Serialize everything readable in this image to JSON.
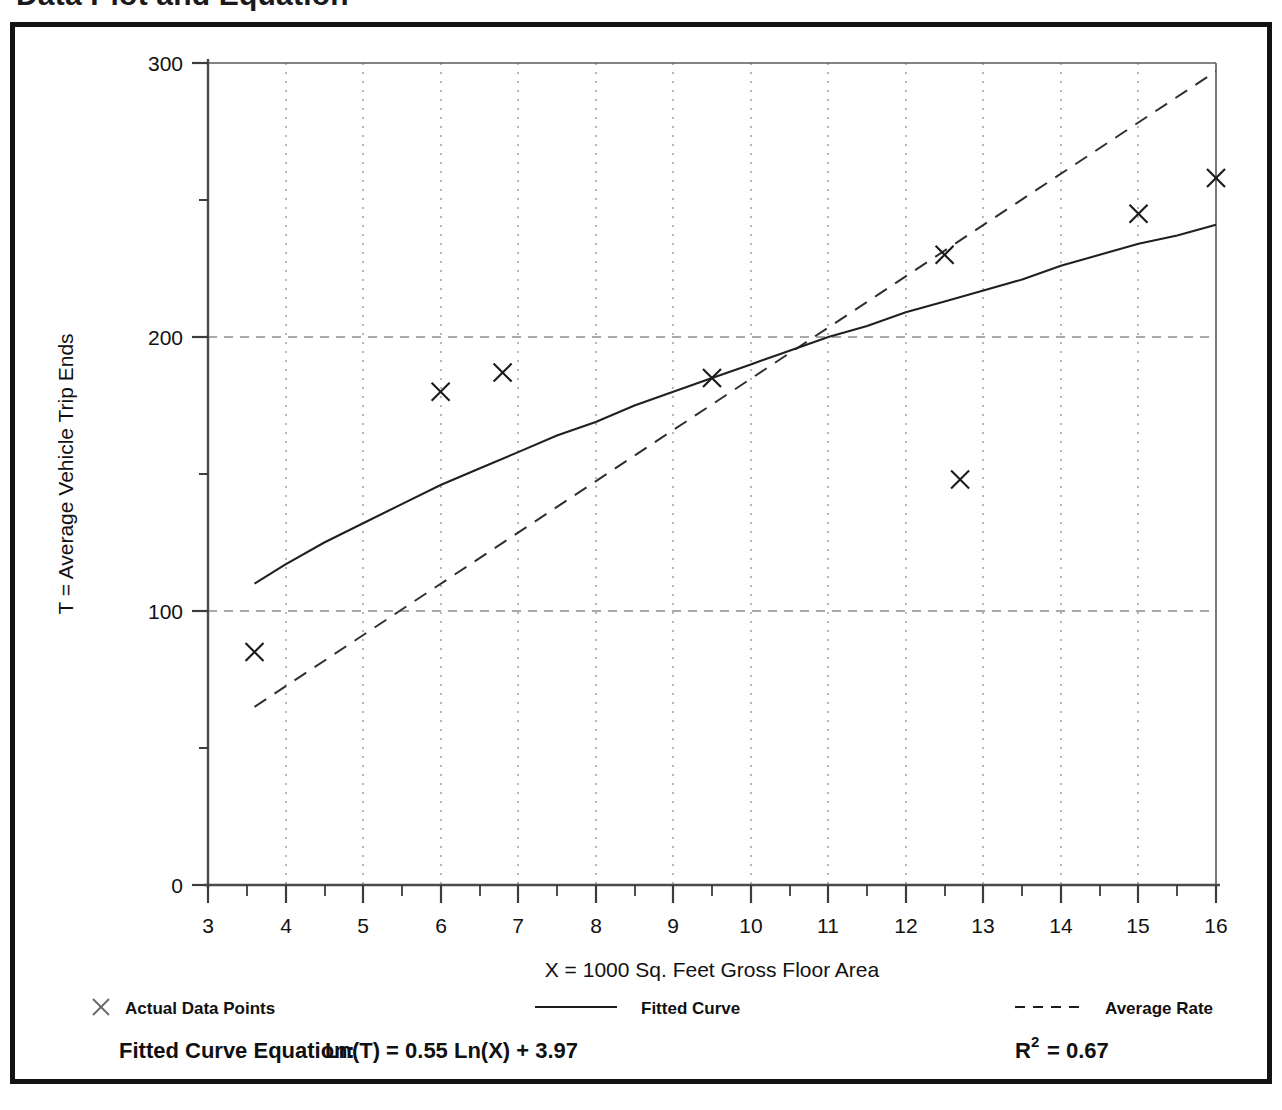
{
  "document": {
    "title": "Data Plot and Equation"
  },
  "chart_data": {
    "type": "scatter",
    "title": "Data Plot and Equation",
    "xlabel": "X = 1000 Sq. Feet Gross Floor Area",
    "ylabel": "T = Average Vehicle Trip Ends",
    "xlim": [
      3,
      16
    ],
    "ylim": [
      0,
      300
    ],
    "x_ticks": [
      3,
      4,
      5,
      6,
      7,
      8,
      9,
      10,
      11,
      12,
      13,
      14,
      15,
      16
    ],
    "x_tick_labels": [
      "3",
      "4",
      "5",
      "6",
      "7",
      "8",
      "9",
      "10",
      "11",
      "12",
      "13",
      "14",
      "15",
      "16"
    ],
    "x_minor_tick_step": 0.5,
    "y_ticks": [
      0,
      100,
      200,
      300
    ],
    "y_tick_labels": [
      "0",
      "100",
      "200",
      "300"
    ],
    "y_minor_ticks": [
      50,
      150,
      250
    ],
    "grid": "dotted vertical at each integer X, dashed horizontal at 100 and 200",
    "legend_position": "below plot",
    "series": [
      {
        "name": "Actual Data Points",
        "marker": "x",
        "style": "scatter",
        "points": [
          {
            "x": 3.6,
            "y": 85
          },
          {
            "x": 6.0,
            "y": 180
          },
          {
            "x": 6.8,
            "y": 187
          },
          {
            "x": 9.5,
            "y": 185
          },
          {
            "x": 12.5,
            "y": 230
          },
          {
            "x": 12.7,
            "y": 148
          },
          {
            "x": 15.0,
            "y": 245
          },
          {
            "x": 16.0,
            "y": 258
          }
        ]
      },
      {
        "name": "Fitted Curve",
        "style": "solid line",
        "equation": "Ln(T) = 0.55 Ln(X) + 3.97",
        "points": [
          {
            "x": 3.6,
            "y": 110
          },
          {
            "x": 4.0,
            "y": 117
          },
          {
            "x": 4.5,
            "y": 125
          },
          {
            "x": 5.0,
            "y": 132
          },
          {
            "x": 5.5,
            "y": 139
          },
          {
            "x": 6.0,
            "y": 146
          },
          {
            "x": 6.5,
            "y": 152
          },
          {
            "x": 7.0,
            "y": 158
          },
          {
            "x": 7.5,
            "y": 164
          },
          {
            "x": 8.0,
            "y": 169
          },
          {
            "x": 8.5,
            "y": 175
          },
          {
            "x": 9.0,
            "y": 180
          },
          {
            "x": 9.5,
            "y": 185
          },
          {
            "x": 10.0,
            "y": 190
          },
          {
            "x": 10.5,
            "y": 195
          },
          {
            "x": 11.0,
            "y": 200
          },
          {
            "x": 11.5,
            "y": 204
          },
          {
            "x": 12.0,
            "y": 209
          },
          {
            "x": 12.5,
            "y": 213
          },
          {
            "x": 13.0,
            "y": 217
          },
          {
            "x": 13.5,
            "y": 221
          },
          {
            "x": 14.0,
            "y": 226
          },
          {
            "x": 14.5,
            "y": 230
          },
          {
            "x": 15.0,
            "y": 234
          },
          {
            "x": 15.5,
            "y": 237
          },
          {
            "x": 16.0,
            "y": 241
          }
        ]
      },
      {
        "name": "Average Rate",
        "style": "dashed line",
        "points": [
          {
            "x": 3.6,
            "y": 65
          },
          {
            "x": 16.0,
            "y": 297
          }
        ]
      }
    ]
  },
  "legend": {
    "items": [
      {
        "label": "Actual Data Points",
        "marker": "x-marker"
      },
      {
        "label": "Fitted Curve",
        "marker": "solid-line-swatch"
      },
      {
        "label": "Average Rate",
        "marker": "dashed-line-swatch"
      }
    ]
  },
  "footer": {
    "equation_label": "Fitted Curve Equation:",
    "equation_value": "Ln(T) = 0.55 Ln(X) + 3.97",
    "r2_label": "R",
    "r2_exponent": "2",
    "r2_value": "= 0.67"
  },
  "colors": {
    "frame": "#131313",
    "axis": "#4a4a4a",
    "ink": "#111111",
    "grid": "#8a8a8a",
    "background": "#ffffff"
  }
}
